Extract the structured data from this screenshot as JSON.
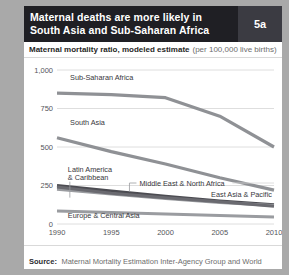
{
  "header": {
    "title": "Maternal deaths are more likely in\nSouth Asia and Sub-Saharan Africa",
    "badge": "5a",
    "bg_color": "#1f1f24",
    "badge_bg_color": "#3b3b42"
  },
  "subtitle": {
    "strong": "Maternal mortality ratio, modeled estimate",
    "light": "(per 100,000 live births)"
  },
  "source": {
    "label": "Source:",
    "text": "Maternal Mortality Estimation Inter-Agency Group and World Development Indicators database."
  },
  "chart_data": {
    "type": "line",
    "title": "Maternal mortality ratio, modeled estimate (per 100,000 live births)",
    "xlabel": "",
    "ylabel": "",
    "x": [
      1990,
      1995,
      2000,
      2005,
      2010
    ],
    "xtick_labels": [
      "1990",
      "1995",
      "2000",
      "2005",
      "2010"
    ],
    "ytick_labels": [
      "0",
      "250",
      "500",
      "750",
      "1,000"
    ],
    "ytick_values": [
      0,
      250,
      500,
      750,
      1000
    ],
    "ylim": [
      0,
      1000
    ],
    "xlim": [
      1990,
      2010
    ],
    "grid": "horizontal",
    "legend": "inline-labels",
    "series": [
      {
        "name": "Sub-Saharan Africa",
        "values": [
          850,
          840,
          820,
          700,
          500
        ],
        "color": "#8f9195",
        "width": 3.2,
        "label_x": 1991.2,
        "label_y": 935
      },
      {
        "name": "South Asia",
        "values": [
          560,
          470,
          390,
          300,
          220
        ],
        "color": "#8f9195",
        "width": 3.2,
        "label_x": 1991.2,
        "label_y": 640
      },
      {
        "name": "Latin America & Caribbean",
        "values": [
          250,
          215,
          180,
          150,
          125
        ],
        "color": "#4c4c52",
        "width": 3.0,
        "label_x": 1991.0,
        "label_y": 340,
        "label_lines": [
          "Latin America",
          "& Caribbean"
        ],
        "leader": true
      },
      {
        "name": "Middle East & North Africa",
        "values": [
          225,
          195,
          165,
          140,
          120
        ],
        "color": "#9a9ca0",
        "width": 3.0,
        "label_x": 1997.6,
        "label_y": 250,
        "leader": true
      },
      {
        "name": "East Asia & Pacific",
        "values": [
          240,
          200,
          170,
          145,
          115
        ],
        "color": "#6a6a70",
        "width": 3.0,
        "label_x": 2004.2,
        "label_y": 175
      },
      {
        "name": "Europe & Central Asia",
        "values": [
          85,
          75,
          65,
          55,
          45
        ],
        "color": "#9a9ca0",
        "width": 3.0,
        "label_x": 1991.0,
        "label_y": 40
      }
    ]
  }
}
